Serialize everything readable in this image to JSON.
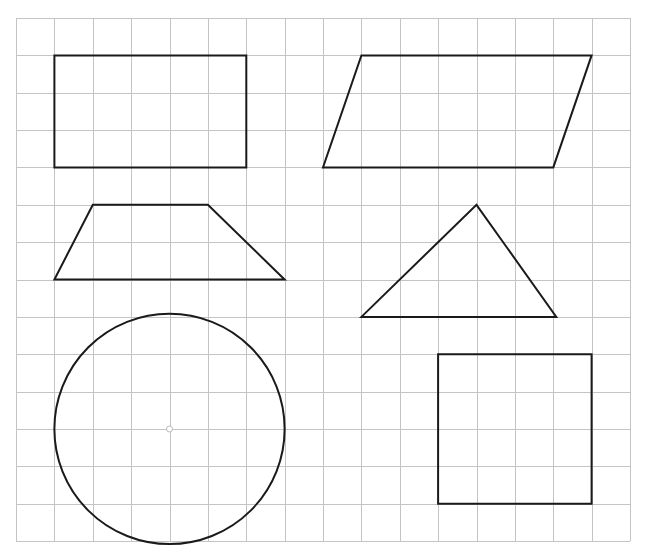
{
  "grid": {
    "origin_x": 16,
    "origin_y": 18,
    "cols": 16,
    "rows": 14,
    "cell_w": 38.375,
    "cell_h": 37.36,
    "line_color": "#c4c4c4",
    "line_width": 1
  },
  "shape_style": {
    "stroke": "#1a1a1a",
    "stroke_width": 2,
    "fill": "none"
  },
  "shapes": [
    {
      "name": "rectangle",
      "type": "polygon",
      "points": [
        [
          1,
          1
        ],
        [
          6,
          1
        ],
        [
          6,
          4
        ],
        [
          1,
          4
        ]
      ]
    },
    {
      "name": "parallelogram",
      "type": "polygon",
      "points": [
        [
          9,
          1
        ],
        [
          15,
          1
        ],
        [
          14,
          4
        ],
        [
          8,
          4
        ]
      ]
    },
    {
      "name": "trapezoid",
      "type": "polygon",
      "points": [
        [
          2,
          5
        ],
        [
          5,
          5
        ],
        [
          7,
          7
        ],
        [
          1,
          7
        ]
      ]
    },
    {
      "name": "triangle",
      "type": "polygon",
      "points": [
        [
          12,
          5
        ],
        [
          14.08,
          8
        ],
        [
          9,
          8
        ]
      ]
    },
    {
      "name": "circle",
      "type": "circle",
      "center": [
        4,
        11
      ],
      "radius_cols": 3,
      "center_marker": true
    },
    {
      "name": "square",
      "type": "polygon",
      "points": [
        [
          11,
          9
        ],
        [
          15,
          9
        ],
        [
          15,
          13
        ],
        [
          11,
          13
        ]
      ]
    }
  ]
}
